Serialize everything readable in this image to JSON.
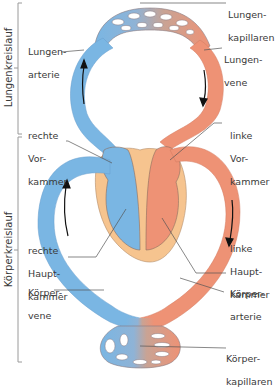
{
  "colors": {
    "venous_blue": "#7ab6e3",
    "arterial_red": "#ee9275",
    "heart_wall": "#f6c48f",
    "outline": "#8a6d5f",
    "label_text": "#3a3a3a",
    "leader_line": "#555555",
    "bracket": "#999999"
  },
  "side_labels": {
    "pulmonary": "Lungenkreislauf",
    "systemic": "Körperkreislauf"
  },
  "labels": {
    "lungenkapillaren": {
      "line1": "Lungen-",
      "line2": "kapillaren"
    },
    "lungenarterie": {
      "line1": "Lungen-",
      "line2": "arterie"
    },
    "lungenvene": {
      "line1": "Lungen-",
      "line2": "vene"
    },
    "rechte_vorkammer": {
      "line1": "rechte",
      "line2": "Vor-",
      "line3": "kammer"
    },
    "linke_vorkammer": {
      "line1": "linke",
      "line2": "Vor-",
      "line3": "kammer"
    },
    "rechte_hauptkammer": {
      "line1": "rechte",
      "line2": "Haupt-",
      "line3": "kammer"
    },
    "linke_hauptkammer": {
      "line1": "linke",
      "line2": "Haupt-",
      "line3": "kammer"
    },
    "koerpervene": {
      "line1": "Körper-",
      "line2": "vene"
    },
    "koerperarterie": {
      "line1": "Körper-",
      "line2": "arterie"
    },
    "koerperkapillaren": {
      "line1": "Körper-",
      "line2": "kapillaren"
    }
  },
  "flow_arrows": [
    {
      "location": "Lungenarterie",
      "direction": "up"
    },
    {
      "location": "Lungenvene",
      "direction": "down"
    },
    {
      "location": "Körpervene",
      "direction": "up"
    },
    {
      "location": "Körperarterie",
      "direction": "down"
    }
  ]
}
